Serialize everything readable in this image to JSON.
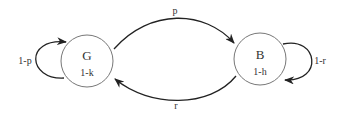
{
  "diagram": {
    "type": "markov-chain",
    "states": [
      {
        "id": "G",
        "label": "G",
        "sublabel": "1-k"
      },
      {
        "id": "B",
        "label": "B",
        "sublabel": "1-h"
      }
    ],
    "transitions": [
      {
        "from": "G",
        "to": "B",
        "label": "p"
      },
      {
        "from": "B",
        "to": "G",
        "label": "r"
      },
      {
        "from": "G",
        "to": "G",
        "label": "1-p"
      },
      {
        "from": "B",
        "to": "B",
        "label": "1-r"
      }
    ],
    "colors": {
      "stroke": "#333333",
      "circle": "#777777",
      "background": "#ffffff"
    }
  }
}
